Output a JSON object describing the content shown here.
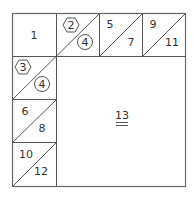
{
  "diagram": {
    "title": "",
    "cells": {
      "c1": "1",
      "c2": "2",
      "c4a": "4",
      "c3": "3",
      "c4b": "4",
      "c5": "5",
      "c7": "7",
      "c9": "9",
      "c11": "11",
      "c6": "6",
      "c8": "8",
      "c10": "10",
      "c12": "12",
      "c13": "13"
    },
    "shapes": {
      "c2": "hexagon",
      "c3": "hexagon",
      "c4a": "circle",
      "c4b": "circle"
    },
    "colors": {
      "line": "#555555",
      "text": "#333333",
      "background": "#ffffff"
    }
  }
}
